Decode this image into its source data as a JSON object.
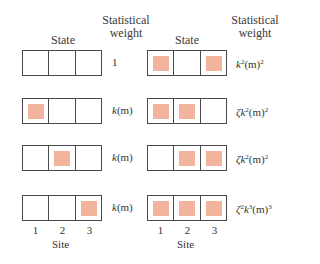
{
  "headers": {
    "left_state": "State",
    "left_weight_line1": "Statistical",
    "left_weight_line2": "weight",
    "right_state": "State",
    "right_weight_line1": "Statistical",
    "right_weight_line2": "weight"
  },
  "colors": {
    "occupied": "#f2b49c",
    "border": "#4a4a4a"
  },
  "left_column": [
    {
      "occupied": [
        false,
        false,
        false
      ],
      "weight_pre": "",
      "weight_k": "",
      "weight_ksup": "",
      "weight_m": "1",
      "weight_msup": ""
    },
    {
      "occupied": [
        true,
        false,
        false
      ],
      "weight_pre": "",
      "weight_k": "k",
      "weight_ksup": "",
      "weight_m": "(m)",
      "weight_msup": ""
    },
    {
      "occupied": [
        false,
        true,
        false
      ],
      "weight_pre": "",
      "weight_k": "k",
      "weight_ksup": "",
      "weight_m": "(m)",
      "weight_msup": ""
    },
    {
      "occupied": [
        false,
        false,
        true
      ],
      "weight_pre": "",
      "weight_k": "k",
      "weight_ksup": "",
      "weight_m": "(m)",
      "weight_msup": ""
    }
  ],
  "right_column": [
    {
      "occupied": [
        true,
        false,
        true
      ],
      "weight_pre": "",
      "weight_k": "k",
      "weight_ksup": "2",
      "weight_m": "(m)",
      "weight_msup": "2"
    },
    {
      "occupied": [
        true,
        true,
        false
      ],
      "weight_pre": "ζ",
      "weight_k": "k",
      "weight_ksup": "2",
      "weight_m": "(m)",
      "weight_msup": "2"
    },
    {
      "occupied": [
        false,
        true,
        true
      ],
      "weight_pre": "ζ",
      "weight_k": "k",
      "weight_ksup": "2",
      "weight_m": "(m)",
      "weight_msup": "2"
    },
    {
      "occupied": [
        true,
        true,
        true
      ],
      "weight_pre": "ζ",
      "weight_presup": "2",
      "weight_k": "k",
      "weight_ksup": "3",
      "weight_m": "(m)",
      "weight_msup": "3"
    }
  ],
  "site_axis": {
    "ticks": [
      "1",
      "2",
      "3"
    ],
    "label": "Site"
  }
}
